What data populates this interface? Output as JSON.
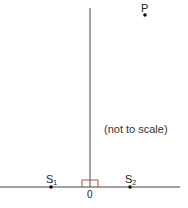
{
  "diagram": {
    "labels": {
      "P": "P",
      "S1_base": "S",
      "S1_sub": "1",
      "S2_base": "S",
      "S2_sub": "2",
      "origin": "0"
    },
    "note": "(not to scale)",
    "colors": {
      "axis": "#555555",
      "right_angle_marker": "#b5532a",
      "point": "#111111"
    }
  }
}
